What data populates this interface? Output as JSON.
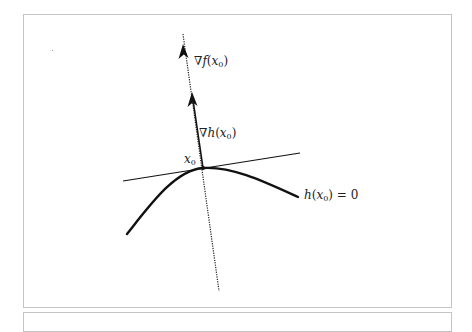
{
  "figure": {
    "type": "constraint-gradient-diagram",
    "labels": {
      "grad_f": {
        "nabla": "∇",
        "func": "f",
        "open": "(",
        "var": "x",
        "sub": "0",
        "close": ")"
      },
      "grad_h": {
        "nabla": "∇",
        "func": "h",
        "open": "(",
        "var": "x",
        "sub": "0",
        "close": ")"
      },
      "point": {
        "var": "x",
        "sub": "0"
      },
      "constraint": {
        "func": "h",
        "open": "(",
        "var": "x",
        "sub": "0",
        "close": ")",
        "rhs": " = 0"
      }
    },
    "colors": {
      "stroke": "#111111",
      "frame": "#c4c4c4",
      "text": "#222222",
      "background": "#ffffff"
    },
    "geometry": {
      "point_x0": [
        203,
        168
      ],
      "dotted_normal_line": [
        [
          183,
          34
        ],
        [
          219,
          291
        ]
      ],
      "grad_h_vector": [
        [
          203,
          168
        ],
        [
          192,
          90
        ]
      ],
      "grad_f_arrowhead": [
        183,
        42
      ],
      "tangent_line": [
        [
          123,
          181
        ],
        [
          300,
          153
        ]
      ],
      "constraint_curve": [
        [
          127,
          234
        ],
        [
          203,
          168
        ],
        [
          298,
          197
        ]
      ]
    }
  }
}
